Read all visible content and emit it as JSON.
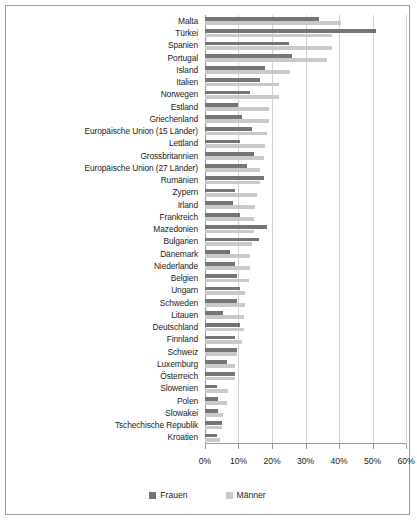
{
  "chart_data": {
    "type": "bar",
    "orientation": "horizontal",
    "title": "",
    "subtitle": "",
    "xlabel": "",
    "ylabel": "",
    "xlim": [
      0,
      60
    ],
    "xtick_labels": [
      "0%",
      "10%",
      "20%",
      "30%",
      "40%",
      "50%",
      "60%"
    ],
    "xtick_values": [
      0,
      10,
      20,
      30,
      40,
      50,
      60
    ],
    "grid": true,
    "legend_position": "bottom",
    "categories": [
      "Malta",
      "Türkei",
      "Spanien",
      "Portugal",
      "Island",
      "Italien",
      "Norwegen",
      "Estland",
      "Griechenland",
      "Europäische Union (15 Länder)",
      "Lettland",
      "Grossbritannien",
      "Europäische Union (27 Länder)",
      "Rumänien",
      "Zypern",
      "Irland",
      "Frankreich",
      "Mazedonien",
      "Bulgarien",
      "Dänemark",
      "Niederlande",
      "Belgien",
      "Ungarn",
      "Schweden",
      "Litauen",
      "Deutschland",
      "Finnland",
      "Schweiz",
      "Luxemburg",
      "Österreich",
      "Slowenien",
      "Polen",
      "Slowakei",
      "Tschechische Republik",
      "Kroatien"
    ],
    "series": [
      {
        "name": "Frauen",
        "color": "#757575",
        "values": [
          34.0,
          51.0,
          25.0,
          26.0,
          18.0,
          16.5,
          13.5,
          10.0,
          11.0,
          14.0,
          10.5,
          14.5,
          12.5,
          17.5,
          9.0,
          8.5,
          10.5,
          18.5,
          16.0,
          7.5,
          9.0,
          9.5,
          10.5,
          9.5,
          5.5,
          10.5,
          9.0,
          9.5,
          6.5,
          9.0,
          3.5,
          4.0,
          4.0,
          5.0,
          3.5
        ]
      },
      {
        "name": "Männer",
        "color": "#c9c9c9",
        "values": [
          40.5,
          38.0,
          38.0,
          36.5,
          25.5,
          22.0,
          22.0,
          19.0,
          19.0,
          18.5,
          18.0,
          17.5,
          16.5,
          16.5,
          15.5,
          15.0,
          14.5,
          14.5,
          14.0,
          13.5,
          13.5,
          13.0,
          12.0,
          12.0,
          11.5,
          11.5,
          11.0,
          9.5,
          9.0,
          9.0,
          7.0,
          6.5,
          5.5,
          5.0,
          4.5
        ]
      }
    ]
  },
  "legend": {
    "items": [
      {
        "label": "Frauen",
        "color": "#757575"
      },
      {
        "label": "Männer",
        "color": "#c9c9c9"
      }
    ]
  },
  "colors": {
    "frauen": "#757575",
    "manner": "#c9c9c9",
    "frame": "#9a9a9a",
    "grid": "#d2d2d2",
    "text": "#1c1c1c",
    "background": "#ffffff"
  }
}
